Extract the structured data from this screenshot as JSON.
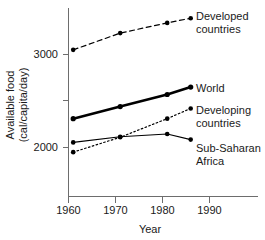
{
  "chart_data": {
    "type": "line",
    "title": "",
    "xlabel": "Year",
    "ylabel": "Available food (cal/capita/day)",
    "ylabel_line1": "Available food",
    "ylabel_line2": "(cal/capita/day)",
    "xlim": [
      1958,
      1996
    ],
    "ylim": [
      1780,
      3470
    ],
    "grid": false,
    "legend_position": "right-inline",
    "xticks": [
      1960,
      1970,
      1980,
      1990
    ],
    "xtick_labels": [
      "1960",
      "1970",
      "1980",
      "1990"
    ],
    "yticks": [
      2000,
      2500,
      3000
    ],
    "ytick_labels": [
      "2000",
      "",
      "3000"
    ],
    "x": [
      1961,
      1971,
      1981,
      1986
    ],
    "series": [
      {
        "name": "Developed countries",
        "label_line1": "Developed",
        "label_line2": "countries",
        "style": "dashed",
        "color": "#000000",
        "values": [
          3050,
          3230,
          3340,
          3390
        ]
      },
      {
        "name": "World",
        "label_line1": "World",
        "label_line2": "",
        "style": "thick-solid",
        "color": "#000000",
        "values": [
          2310,
          2440,
          2570,
          2650
        ]
      },
      {
        "name": "Developing countries",
        "label_line1": "Developing",
        "label_line2": "countries",
        "style": "dotted",
        "color": "#000000",
        "values": [
          1950,
          2110,
          2310,
          2420
        ]
      },
      {
        "name": "Sub-Saharan Africa",
        "label_line1": "Sub-Saharan",
        "label_line2": "Africa",
        "style": "thin-solid",
        "color": "#000000",
        "values": [
          2055,
          2115,
          2145,
          2085
        ]
      }
    ]
  }
}
